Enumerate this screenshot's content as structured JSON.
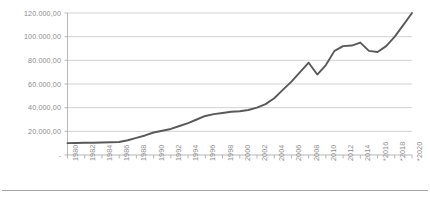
{
  "chart_data": {
    "type": "line",
    "title": "",
    "subtitle": "",
    "xlabel": "",
    "ylabel": "",
    "grid": true,
    "legend": null,
    "ylim": [
      0,
      120000
    ],
    "yticks": [
      0,
      20000,
      40000,
      60000,
      80000,
      100000,
      120000
    ],
    "ytick_labels": [
      "-",
      "20.000,00",
      "40.000,00",
      "60.000,00",
      "80.000,00",
      "100.000,00",
      "120.000,00"
    ],
    "number_format": "european (dot thousands, comma decimals)",
    "xtick_labels": [
      "1980",
      "1982",
      "1984",
      "1986",
      "1988",
      "1990",
      "1992",
      "1994",
      "1996",
      "1998",
      "2000",
      "2002",
      "2004",
      "2006",
      "2008",
      "2010",
      "2012",
      "2014",
      "*2016",
      "*2018",
      "*2020"
    ],
    "footnote": "* marks projected years",
    "x": [
      1980,
      1981,
      1982,
      1983,
      1984,
      1985,
      1986,
      1987,
      1988,
      1989,
      1990,
      1991,
      1992,
      1993,
      1994,
      1995,
      1996,
      1997,
      1998,
      1999,
      2000,
      2001,
      2002,
      2003,
      2004,
      2005,
      2006,
      2007,
      2008,
      2009,
      2010,
      2011,
      2012,
      2013,
      2014,
      2015,
      2016,
      2017,
      2018,
      2019,
      2020
    ],
    "series": [
      {
        "name": "value",
        "color": "#595959",
        "values": [
          10000,
          10200,
          10300,
          10400,
          10600,
          10800,
          11000,
          12500,
          14500,
          16500,
          19000,
          20500,
          22000,
          24500,
          27000,
          30000,
          33000,
          34500,
          35500,
          36500,
          37000,
          38000,
          40000,
          43000,
          48000,
          55000,
          62000,
          70000,
          78000,
          68000,
          76000,
          88000,
          92000,
          92500,
          95000,
          88000,
          87000,
          92000,
          100000,
          110000,
          120000
        ]
      }
    ],
    "axis_colors": {
      "gridline": "#bfbfbf",
      "axis": "#a6a6a6",
      "tick_text": "#8c8c8c",
      "line": "#595959"
    }
  }
}
